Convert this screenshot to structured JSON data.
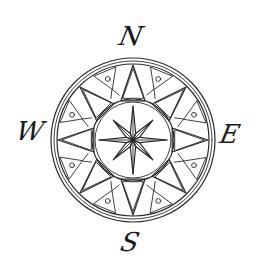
{
  "figure": {
    "kind": "compass-rose-line-drawing",
    "ink_color": "#2a2a2a",
    "background": "#ffffff",
    "center": [
      133,
      140
    ],
    "outer_ring": {
      "r_outer": 82,
      "r_inner": 76,
      "r_mid_line": 79
    },
    "inner_circle": {
      "r": 41,
      "r2": 38
    },
    "large_triangles": {
      "count": 8,
      "tip_r": 75,
      "base_r": 41,
      "half_angle_deg": 17
    },
    "small_triangles": {
      "count": 8,
      "offset_deg": 22.5,
      "tip_r": 75,
      "base_r": 55,
      "half_angle_deg": 9
    },
    "center_star": {
      "points": 8,
      "long_r": 34,
      "short_r": 28,
      "waist_r": 7
    }
  },
  "labels": {
    "north": {
      "text": "N",
      "x": 131,
      "y": 36
    },
    "west": {
      "text": "W",
      "x": 30,
      "y": 131
    },
    "east": {
      "text": "E",
      "x": 230,
      "y": 134
    },
    "south": {
      "text": "S",
      "x": 130,
      "y": 242
    }
  }
}
